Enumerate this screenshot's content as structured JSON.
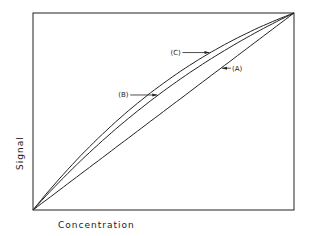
{
  "chart_data": {
    "type": "line",
    "title": "",
    "xlabel": "Concentration",
    "ylabel": "Signal",
    "xlim": [
      0,
      1
    ],
    "ylim": [
      0,
      1
    ],
    "grid": false,
    "series": [
      {
        "name": "(A)",
        "curvature": 0.0
      },
      {
        "name": "(B)",
        "curvature": 0.18
      },
      {
        "name": "(C)",
        "curvature": 0.25
      }
    ],
    "annotations": [
      {
        "label": "(A)",
        "target": "A",
        "at_x": 0.72
      },
      {
        "label": "(B)",
        "target": "B",
        "at_x": 0.48
      },
      {
        "label": "(C)",
        "target": "C",
        "at_x": 0.68
      }
    ]
  }
}
